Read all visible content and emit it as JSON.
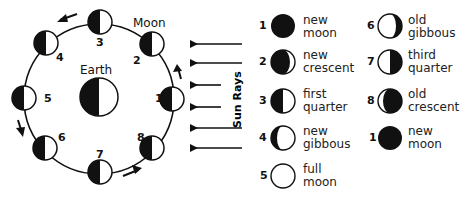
{
  "diagram": {
    "center_label": "Earth",
    "moon_label": "Moon",
    "sun_rays_label": "Sun Rays",
    "orbit_positions": [
      {
        "num": "1",
        "x": 172,
        "y": 99,
        "label_x": 155,
        "label_y": 92
      },
      {
        "num": "2",
        "x": 152,
        "y": 44,
        "label_x": 133,
        "label_y": 54
      },
      {
        "num": "3",
        "x": 100,
        "y": 22,
        "label_x": 96,
        "label_y": 36
      },
      {
        "num": "4",
        "x": 46,
        "y": 43,
        "label_x": 56,
        "label_y": 51
      },
      {
        "num": "5",
        "x": 24,
        "y": 98,
        "label_x": 44,
        "label_y": 92
      },
      {
        "num": "6",
        "x": 45,
        "y": 148,
        "label_x": 58,
        "label_y": 131
      },
      {
        "num": "7",
        "x": 100,
        "y": 172,
        "label_x": 96,
        "label_y": 148
      },
      {
        "num": "8",
        "x": 152,
        "y": 148,
        "label_x": 137,
        "label_y": 131
      }
    ],
    "orbit_direction": "counterclockwise",
    "sun_ray_count": 6
  },
  "legend": {
    "items": [
      {
        "num": "1",
        "line1": "new",
        "line2": "moon",
        "phase": "new"
      },
      {
        "num": "2",
        "line1": "new",
        "line2": "crescent",
        "phase": "waxing-crescent"
      },
      {
        "num": "3",
        "line1": "first",
        "line2": "quarter",
        "phase": "first-quarter"
      },
      {
        "num": "4",
        "line1": "new",
        "line2": "gibbous",
        "phase": "waxing-gibbous"
      },
      {
        "num": "5",
        "line1": "full",
        "line2": "moon",
        "phase": "full"
      },
      {
        "num": "6",
        "line1": "old",
        "line2": "gibbous",
        "phase": "waning-gibbous"
      },
      {
        "num": "7",
        "line1": "third",
        "line2": "quarter",
        "phase": "third-quarter"
      },
      {
        "num": "8",
        "line1": "old",
        "line2": "crescent",
        "phase": "waning-crescent"
      },
      {
        "num": "1",
        "line1": "new",
        "line2": "moon",
        "phase": "new"
      }
    ]
  },
  "colors": {
    "ink": "#111111",
    "background": "#ffffff"
  }
}
